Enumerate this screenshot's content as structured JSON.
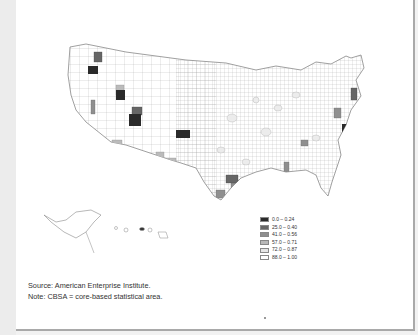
{
  "map": {
    "region": "United States (CBSA / county level)",
    "legend": {
      "items": [
        {
          "label": "0.0 – 0.24",
          "color": "#2a2a2a"
        },
        {
          "label": "25.0 – 0.40",
          "color": "#666666"
        },
        {
          "label": "41.0 – 0.56",
          "color": "#8e8e8e"
        },
        {
          "label": "57.0 – 0.71",
          "color": "#b9b9b9"
        },
        {
          "label": "72.0 – 0.87",
          "color": "#e6e6e6"
        },
        {
          "label": "88.0 – 1.00",
          "color": "#ffffff"
        }
      ]
    }
  },
  "footer": {
    "source": "Source: American Enterprise Institute.",
    "note": "Note: CBSA = core-based statistical area."
  }
}
